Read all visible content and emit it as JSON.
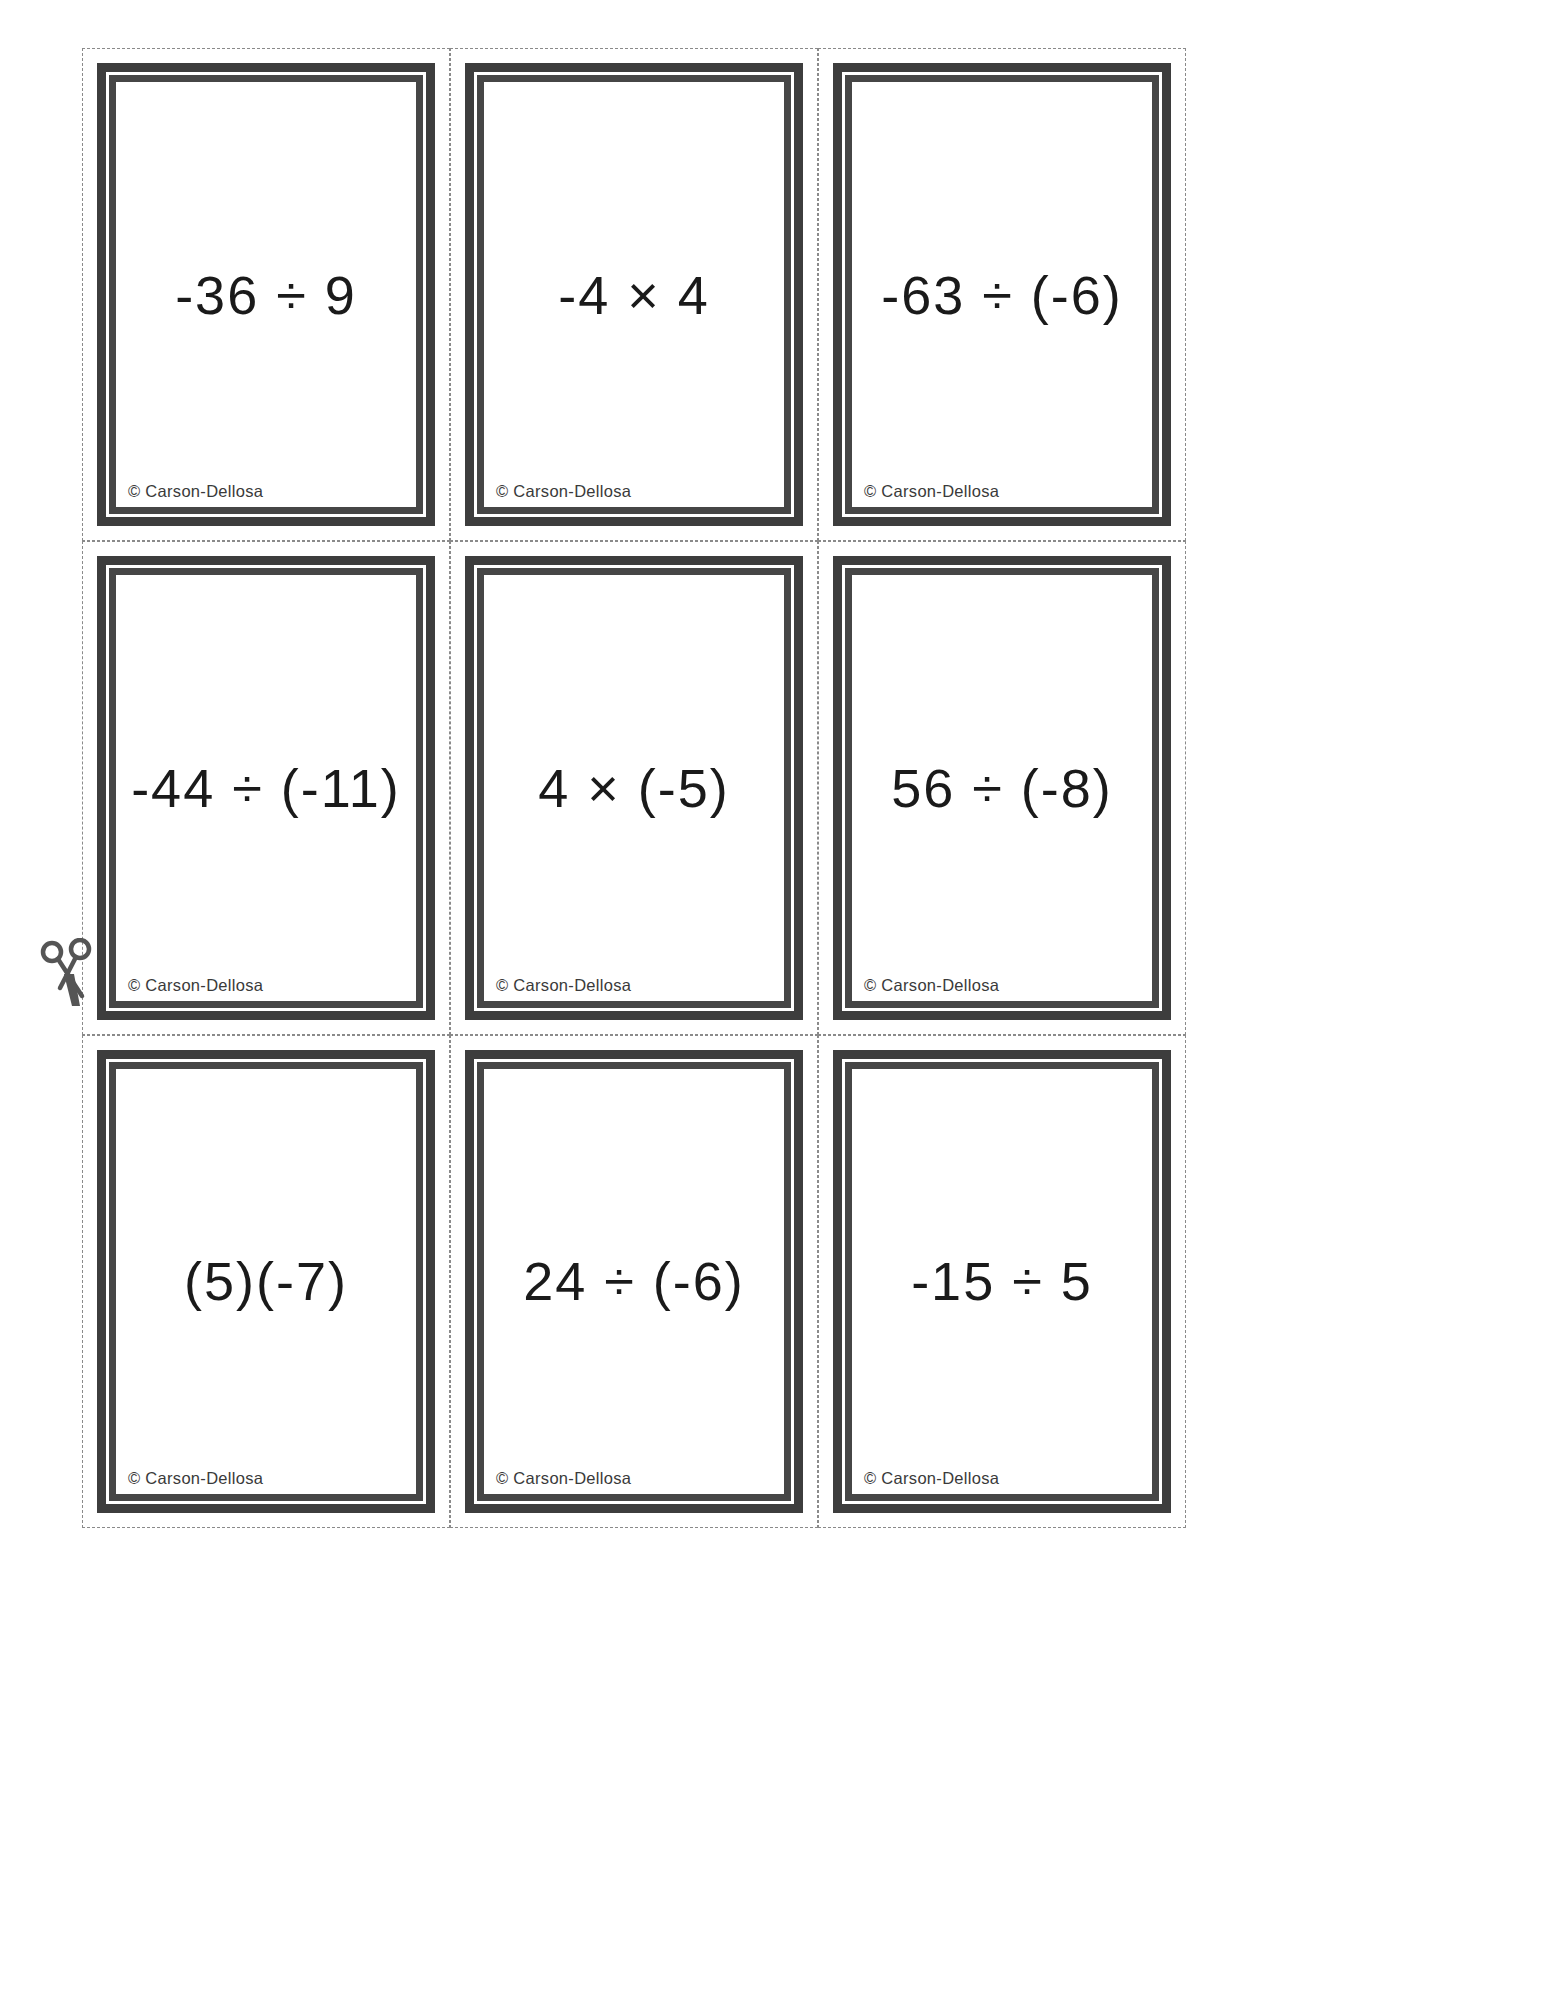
{
  "page": {
    "type": "printable-flash-card-sheet",
    "background_color": "#ffffff",
    "cut_line_color": "#8a8a8a",
    "card_frame_color": "#3d3d3d",
    "text_color": "#1a1a1a",
    "columns": 3,
    "rows": 3
  },
  "scissors": {
    "icon": "scissors-icon",
    "color": "#555555"
  },
  "copyright_label": "© Carson-Dellosa",
  "cards": [
    {
      "expression": "-36 ÷ 9",
      "copyright": "© Carson-Dellosa"
    },
    {
      "expression": "-4 × 4",
      "copyright": "© Carson-Dellosa"
    },
    {
      "expression": "-63 ÷ (-6)",
      "copyright": "© Carson-Dellosa"
    },
    {
      "expression": "-44 ÷ (-11)",
      "copyright": "© Carson-Dellosa"
    },
    {
      "expression": "4 × (-5)",
      "copyright": "© Carson-Dellosa"
    },
    {
      "expression": "56 ÷ (-8)",
      "copyright": "© Carson-Dellosa"
    },
    {
      "expression": "(5)(-7)",
      "copyright": "© Carson-Dellosa"
    },
    {
      "expression": "24 ÷ (-6)",
      "copyright": "© Carson-Dellosa"
    },
    {
      "expression": "-15 ÷ 5",
      "copyright": "© Carson-Dellosa"
    }
  ]
}
